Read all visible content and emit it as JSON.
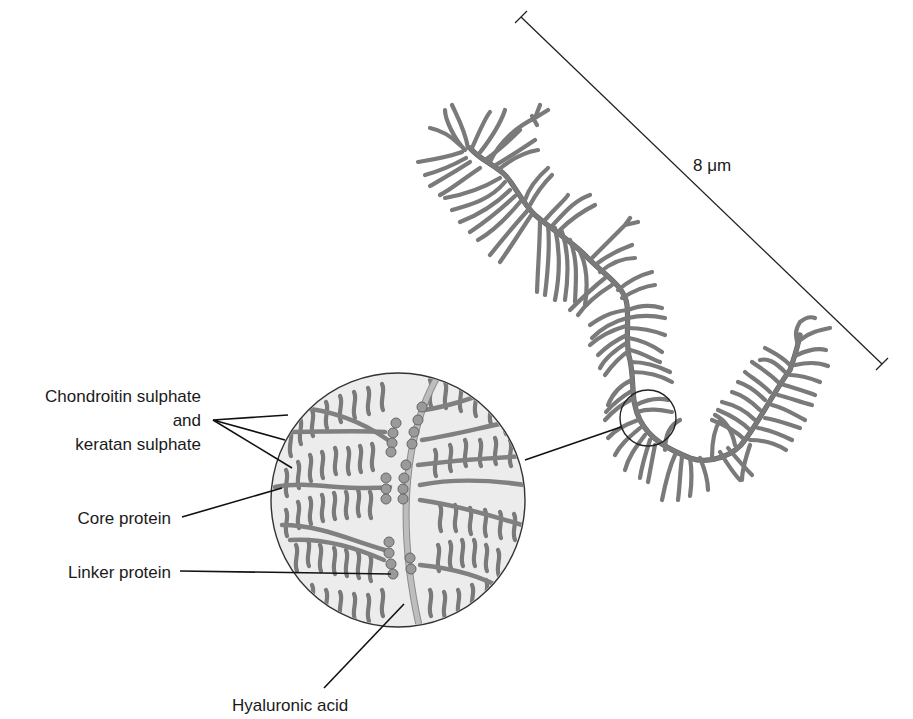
{
  "figure": {
    "scale_bar": {
      "label": "8 μm",
      "x1": 521,
      "y1": 17,
      "x2": 882,
      "y2": 364
    },
    "inset": {
      "cx": 398,
      "cy": 500,
      "r": 127,
      "fill": "#e9e9e9",
      "stroke": "#333333"
    },
    "zoom_marker": {
      "cx": 648,
      "cy": 418,
      "r": 28
    },
    "colors": {
      "chain": "#7a7a7a",
      "hyaluronic_acid": "#bdbdbd",
      "bead": "#9a9a9a",
      "text": "#1a1a1a",
      "leader": "#111111"
    }
  },
  "labels": {
    "chondroitin_line1": "Chondroitin sulphate",
    "chondroitin_line2": "and",
    "chondroitin_line3": "keratan sulphate",
    "core_protein": "Core protein",
    "linker_protein": "Linker protein",
    "hyaluronic_acid": "Hyaluronic acid",
    "scale": "8 μm"
  }
}
